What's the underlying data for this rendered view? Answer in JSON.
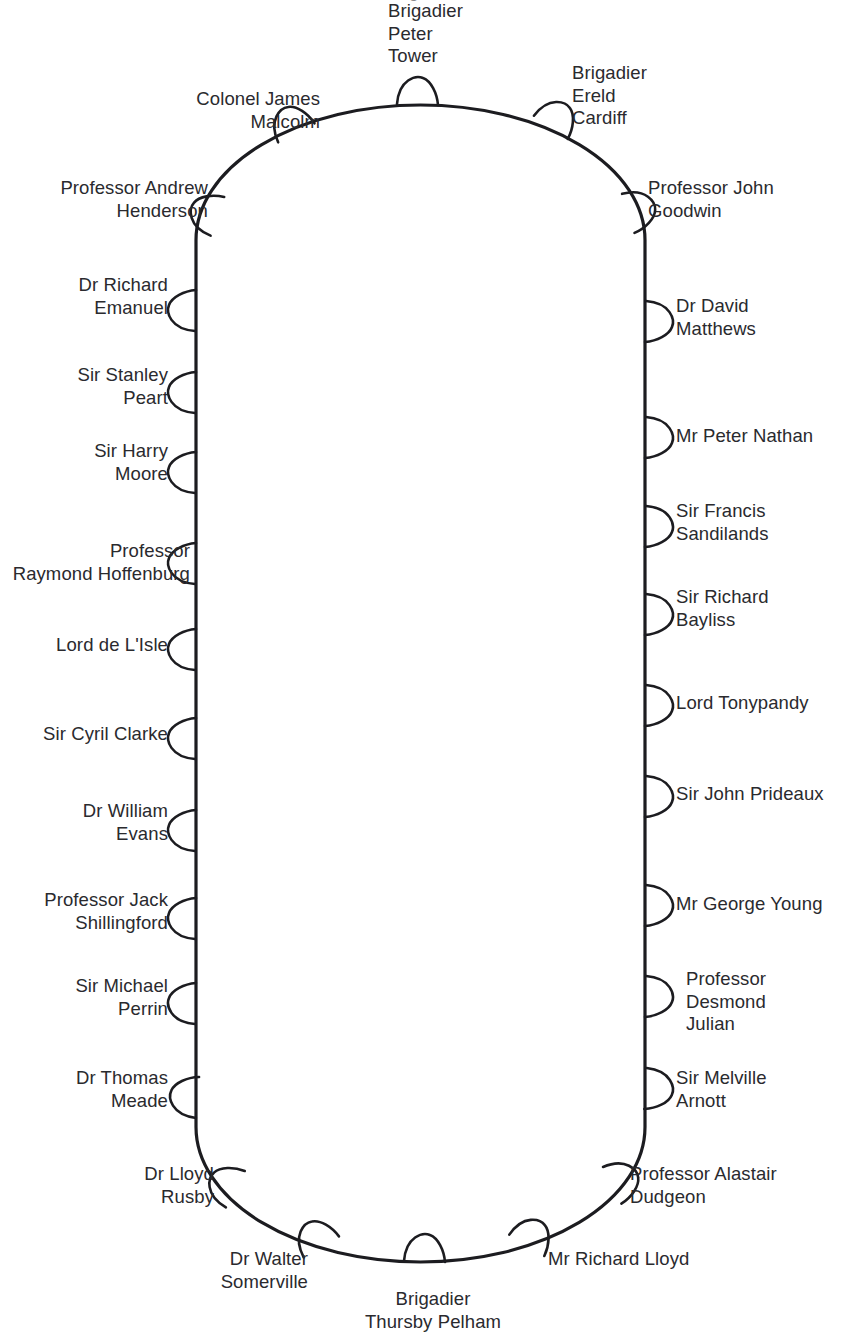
{
  "diagram": {
    "type": "seating-plan",
    "shape": "stadium",
    "table": {
      "left": 196,
      "right": 645,
      "top": 105,
      "bottom": 1262,
      "stroke_color": "#1c1c20",
      "stroke_width": 3.2,
      "fill_color": "#ffffff"
    },
    "chair_count": 28,
    "text_color": "#2a2a2e",
    "background_color": "#ffffff"
  },
  "cut_off_line": {
    "text": "Brigadier",
    "note": "partially cropped line of text above the visible top edge"
  },
  "seats": [
    {
      "id": "seat-brigadier-peter-tower",
      "name": "Brigadier\nPeter\nTower",
      "side": "top",
      "label_x": 388,
      "label_y": 0,
      "label_w": 130,
      "align": "left",
      "chair_cx": 418,
      "chair_cy": 105,
      "chair_angle": 270
    },
    {
      "id": "seat-colonel-james-malcolm",
      "name": "Colonel James\nMalcolm",
      "side": "top-left",
      "label_x": 120,
      "label_y": 88,
      "label_w": 200,
      "align": "right",
      "chair_cx": 297,
      "chair_cy": 133,
      "chair_angle": 241
    },
    {
      "id": "seat-professor-andrew-henderson",
      "name": "Professor Andrew\nHenderson",
      "side": "left",
      "label_x": 22,
      "label_y": 177,
      "label_w": 186,
      "align": "right",
      "chair_cx": 218,
      "chair_cy": 216,
      "chair_angle": 198
    },
    {
      "id": "seat-dr-richard-emanuel",
      "name": "Dr Richard\nEmanuel",
      "side": "left",
      "label_x": 30,
      "label_y": 274,
      "label_w": 138,
      "align": "right",
      "chair_cx": 196,
      "chair_cy": 310,
      "chair_angle": 180
    },
    {
      "id": "seat-sir-stanley-peart",
      "name": "Sir Stanley\nPeart",
      "side": "left",
      "label_x": 30,
      "label_y": 364,
      "label_w": 138,
      "align": "right",
      "chair_cx": 196,
      "chair_cy": 392,
      "chair_angle": 180
    },
    {
      "id": "seat-sir-harry-moore",
      "name": "Sir Harry\nMoore",
      "side": "left",
      "label_x": 30,
      "label_y": 440,
      "label_w": 138,
      "align": "right",
      "chair_cx": 196,
      "chair_cy": 472,
      "chair_angle": 180
    },
    {
      "id": "seat-professor-raymond-hoffenburg",
      "name": "Professor\nRaymond Hoffenburg",
      "side": "left",
      "label_x": 0,
      "label_y": 540,
      "label_w": 190,
      "align": "right",
      "chair_cx": 196,
      "chair_cy": 563,
      "chair_angle": 180
    },
    {
      "id": "seat-lord-de-lisle",
      "name": "Lord de L'Isle",
      "side": "left",
      "label_x": 12,
      "label_y": 634,
      "label_w": 156,
      "align": "right",
      "chair_cx": 196,
      "chair_cy": 649,
      "chair_angle": 180
    },
    {
      "id": "seat-sir-cyril-clarke",
      "name": "Sir Cyril Clarke",
      "side": "left",
      "label_x": 12,
      "label_y": 723,
      "label_w": 156,
      "align": "right",
      "chair_cx": 196,
      "chair_cy": 738,
      "chair_angle": 180
    },
    {
      "id": "seat-dr-william-evans",
      "name": "Dr William\nEvans",
      "side": "left",
      "label_x": 30,
      "label_y": 800,
      "label_w": 138,
      "align": "right",
      "chair_cx": 196,
      "chair_cy": 830,
      "chair_angle": 180
    },
    {
      "id": "seat-professor-jack-shillingford",
      "name": "Professor Jack\nShillingford",
      "side": "left",
      "label_x": 12,
      "label_y": 889,
      "label_w": 156,
      "align": "right",
      "chair_cx": 196,
      "chair_cy": 918,
      "chair_angle": 180
    },
    {
      "id": "seat-sir-michael-perrin",
      "name": "Sir Michael\nPerrin",
      "side": "left",
      "label_x": 30,
      "label_y": 975,
      "label_w": 138,
      "align": "right",
      "chair_cx": 196,
      "chair_cy": 1003,
      "chair_angle": 180
    },
    {
      "id": "seat-dr-thomas-meade",
      "name": "Dr Thomas\nMeade",
      "side": "left",
      "label_x": 30,
      "label_y": 1067,
      "label_w": 138,
      "align": "right",
      "chair_cx": 198,
      "chair_cy": 1097,
      "chair_angle": 183
    },
    {
      "id": "seat-dr-lloyd-rusby",
      "name": "Dr Lloyd\nRusby",
      "side": "bottom-left",
      "label_x": 86,
      "label_y": 1163,
      "label_w": 128,
      "align": "right",
      "chair_cx": 236,
      "chair_cy": 1189,
      "chair_angle": 206
    },
    {
      "id": "seat-dr-walter-somerville",
      "name": "Dr Walter\nSomerville",
      "side": "bottom-left",
      "label_x": 150,
      "label_y": 1248,
      "label_w": 158,
      "align": "right",
      "chair_cx": 322,
      "chair_cy": 1247,
      "chair_angle": 238
    },
    {
      "id": "seat-brigadier-thursby-pelham",
      "name": "Brigadier\nThursby Pelham",
      "side": "bottom",
      "label_x": 353,
      "label_y": 1288,
      "label_w": 160,
      "align": "center",
      "chair_cx": 425,
      "chair_cy": 1262,
      "chair_angle": 270
    },
    {
      "id": "seat-mr-richard-lloyd",
      "name": "Mr Richard Lloyd",
      "side": "bottom-right",
      "label_x": 548,
      "label_y": 1248,
      "label_w": 180,
      "align": "left",
      "chair_cx": 527,
      "chair_cy": 1246,
      "chair_angle": 300
    },
    {
      "id": "seat-professor-alastair-dudgeon",
      "name": "Professor Alastair\nDudgeon",
      "side": "bottom-right",
      "label_x": 630,
      "label_y": 1163,
      "label_w": 190,
      "align": "left",
      "chair_cx": 612,
      "chair_cy": 1186,
      "chair_angle": 332
    },
    {
      "id": "seat-sir-melville-arnott",
      "name": "Sir Melville\nArnott",
      "side": "right",
      "label_x": 676,
      "label_y": 1067,
      "label_w": 150,
      "align": "left",
      "chair_cx": 645,
      "chair_cy": 1089,
      "chair_angle": 2
    },
    {
      "id": "seat-professor-desmond-julian",
      "name": "Professor\nDesmond\nJulian",
      "side": "right",
      "label_x": 686,
      "label_y": 968,
      "label_w": 150,
      "align": "left",
      "chair_cx": 645,
      "chair_cy": 997,
      "chair_angle": 0
    },
    {
      "id": "seat-mr-george-young",
      "name": "Mr George Young",
      "side": "right",
      "label_x": 676,
      "label_y": 893,
      "label_w": 180,
      "align": "left",
      "chair_cx": 645,
      "chair_cy": 906,
      "chair_angle": 0
    },
    {
      "id": "seat-sir-john-prideaux",
      "name": "Sir John Prideaux",
      "side": "right",
      "label_x": 676,
      "label_y": 783,
      "label_w": 180,
      "align": "left",
      "chair_cx": 645,
      "chair_cy": 797,
      "chair_angle": 0
    },
    {
      "id": "seat-lord-tonypandy",
      "name": "Lord Tonypandy",
      "side": "right",
      "label_x": 676,
      "label_y": 692,
      "label_w": 180,
      "align": "left",
      "chair_cx": 645,
      "chair_cy": 706,
      "chair_angle": 0
    },
    {
      "id": "seat-sir-richard-bayliss",
      "name": "Sir Richard\nBayliss",
      "side": "right",
      "label_x": 676,
      "label_y": 586,
      "label_w": 160,
      "align": "left",
      "chair_cx": 645,
      "chair_cy": 615,
      "chair_angle": 0
    },
    {
      "id": "seat-sir-francis-sandilands",
      "name": "Sir Francis\nSandilands",
      "side": "right",
      "label_x": 676,
      "label_y": 500,
      "label_w": 160,
      "align": "left",
      "chair_cx": 645,
      "chair_cy": 527,
      "chair_angle": 0
    },
    {
      "id": "seat-mr-peter-nathan",
      "name": "Mr Peter Nathan",
      "side": "right",
      "label_x": 676,
      "label_y": 425,
      "label_w": 180,
      "align": "left",
      "chair_cx": 645,
      "chair_cy": 438,
      "chair_angle": 0
    },
    {
      "id": "seat-dr-david-matthews",
      "name": "Dr David\nMatthews",
      "side": "right",
      "label_x": 676,
      "label_y": 295,
      "label_w": 160,
      "align": "left",
      "chair_cx": 645,
      "chair_cy": 322,
      "chair_angle": 0
    },
    {
      "id": "seat-professor-john-goodwin",
      "name": "Professor John\nGoodwin",
      "side": "right",
      "label_x": 648,
      "label_y": 177,
      "label_w": 190,
      "align": "left",
      "chair_cx": 628,
      "chair_cy": 214,
      "chair_angle": 341
    },
    {
      "id": "seat-brigadier-ereld-cardiff",
      "name": "Brigadier\nEreld\nCardiff",
      "side": "top-right",
      "label_x": 572,
      "label_y": 62,
      "label_w": 150,
      "align": "left",
      "chair_cx": 551,
      "chair_cy": 128,
      "chair_angle": 303
    }
  ]
}
